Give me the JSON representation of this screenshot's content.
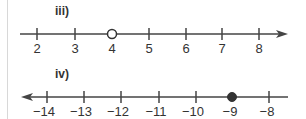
{
  "lines": [
    {
      "label": "iii)",
      "direction": "right",
      "ticks": [
        "2",
        "3",
        "4",
        "5",
        "6",
        "7",
        "8"
      ],
      "point": {
        "value": "4",
        "style": "open"
      }
    },
    {
      "label": "iv)",
      "direction": "left",
      "ticks": [
        "−14",
        "−13",
        "−12",
        "−11",
        "−10",
        "−9",
        "−8"
      ],
      "point": {
        "value": "−9",
        "style": "closed"
      }
    }
  ],
  "colors": {
    "line": "#444444",
    "point": "#333333"
  }
}
